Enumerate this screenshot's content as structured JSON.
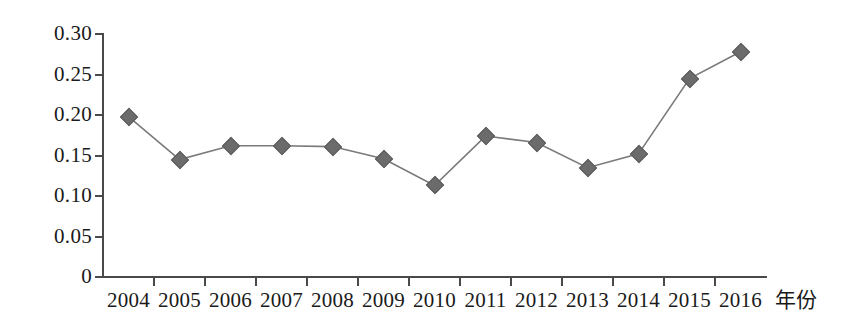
{
  "chart_data": {
    "type": "line",
    "title": "",
    "xlabel": "年份",
    "ylabel": "",
    "categories": [
      "2004",
      "2005",
      "2006",
      "2007",
      "2008",
      "2009",
      "2010",
      "2011",
      "2012",
      "2013",
      "2014",
      "2015",
      "2016"
    ],
    "values": [
      0.198,
      0.145,
      0.162,
      0.162,
      0.161,
      0.146,
      0.113,
      0.174,
      0.166,
      0.135,
      0.152,
      0.245,
      0.278
    ],
    "series": [
      {
        "name": "",
        "values": [
          0.198,
          0.145,
          0.162,
          0.162,
          0.161,
          0.146,
          0.113,
          0.174,
          0.166,
          0.135,
          0.152,
          0.245,
          0.278
        ]
      }
    ],
    "ylim": [
      0,
      0.3
    ],
    "ytick_labels": [
      "0.30",
      "0.25",
      "0.20",
      "0.15",
      "0.10",
      "0.05",
      "0"
    ],
    "ytick_values": [
      0.3,
      0.25,
      0.2,
      0.15,
      0.1,
      0.05,
      0
    ],
    "grid": false,
    "legend": false,
    "legend_position": "none",
    "marker_shape": "diamond",
    "marker_color": "#6b6b6b",
    "line_color": "#7a7a7a",
    "axis_color": "#4a4a4a",
    "text_color": "#1a1a1a"
  }
}
